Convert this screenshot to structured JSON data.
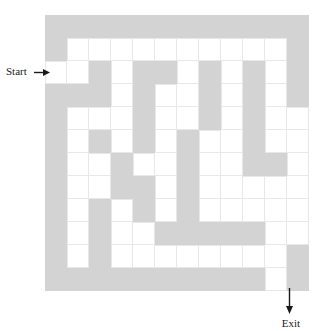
{
  "figure": {
    "kind": "maze-diagram",
    "width": 334,
    "height": 331,
    "background_color": "#ffffff"
  },
  "maze": {
    "rows": 12,
    "cols": 12,
    "cell_width": 22,
    "cell_height": 23,
    "origin_x": 45,
    "origin_y": 15,
    "wall_color": "#d3d3d3",
    "open_color": "#ffffff",
    "gridline_color": "#e8e8e8",
    "legend": {
      "wall": "gray filled square",
      "open": "white passage square"
    },
    "grid": [
      [
        1,
        1,
        1,
        1,
        1,
        1,
        1,
        1,
        1,
        1,
        1,
        1
      ],
      [
        1,
        0,
        0,
        0,
        0,
        0,
        0,
        0,
        0,
        0,
        0,
        1
      ],
      [
        0,
        0,
        1,
        0,
        1,
        1,
        0,
        1,
        0,
        1,
        0,
        1
      ],
      [
        1,
        1,
        1,
        0,
        1,
        0,
        0,
        1,
        0,
        1,
        0,
        1
      ],
      [
        1,
        0,
        0,
        0,
        1,
        0,
        0,
        1,
        0,
        1,
        0,
        0
      ],
      [
        1,
        0,
        1,
        0,
        1,
        0,
        1,
        0,
        0,
        1,
        0,
        0
      ],
      [
        1,
        0,
        0,
        1,
        0,
        0,
        1,
        0,
        0,
        1,
        1,
        0
      ],
      [
        1,
        0,
        0,
        1,
        1,
        0,
        1,
        0,
        0,
        0,
        0,
        0
      ],
      [
        1,
        0,
        1,
        0,
        1,
        0,
        1,
        0,
        0,
        0,
        0,
        0
      ],
      [
        1,
        0,
        1,
        0,
        0,
        1,
        1,
        1,
        1,
        1,
        0,
        0
      ],
      [
        1,
        0,
        1,
        0,
        0,
        0,
        0,
        0,
        0,
        0,
        0,
        1
      ],
      [
        1,
        1,
        1,
        1,
        1,
        1,
        1,
        1,
        1,
        1,
        0,
        1
      ]
    ]
  },
  "annotations": {
    "start": {
      "label": "Start",
      "icon": "arrow-right-icon",
      "points_to": "row 2, left entrance"
    },
    "exit": {
      "label": "Exit",
      "icon": "arrow-down-icon",
      "points_to": "row 11, bottom-right opening"
    }
  }
}
